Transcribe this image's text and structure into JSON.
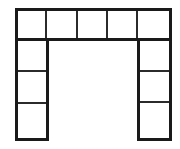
{
  "diagram": {
    "type": "floor-plan-schematic",
    "canvas": {
      "width": 180,
      "height": 149
    },
    "background_color": "#ffffff",
    "stroke_color": "#1a1a1a",
    "inner_stroke_color": "#2b2b2b",
    "fill_color": "#ffffff",
    "outer_stroke_width": 3,
    "inner_stroke_width": 2,
    "bounds": {
      "left": 16,
      "top": 9,
      "right": 170,
      "bottom": 139
    },
    "courtyard": {
      "label": "",
      "left": 47,
      "top": 39,
      "right": 138,
      "bottom": 139,
      "open": true
    },
    "top_row": {
      "label": "",
      "top": 9,
      "bottom": 39,
      "cell_count": 5,
      "x_edges": [
        16,
        46,
        77,
        107,
        137,
        170
      ],
      "cells": [
        {
          "label": "",
          "x": 16,
          "y": 9,
          "w": 30,
          "h": 30
        },
        {
          "label": "",
          "x": 46,
          "y": 9,
          "w": 31,
          "h": 30
        },
        {
          "label": "",
          "x": 77,
          "y": 9,
          "w": 30,
          "h": 30
        },
        {
          "label": "",
          "x": 107,
          "y": 9,
          "w": 30,
          "h": 30
        },
        {
          "label": "",
          "x": 137,
          "y": 9,
          "w": 33,
          "h": 30
        }
      ]
    },
    "left_leg": {
      "label": "",
      "left": 16,
      "right": 47,
      "top": 39,
      "bottom": 139,
      "cell_count": 3,
      "y_edges": [
        39,
        71,
        103,
        139
      ],
      "cells": [
        {
          "label": "",
          "x": 16,
          "y": 39,
          "w": 31,
          "h": 32
        },
        {
          "label": "",
          "x": 16,
          "y": 71,
          "w": 31,
          "h": 32
        },
        {
          "label": "",
          "x": 16,
          "y": 103,
          "w": 31,
          "h": 36
        }
      ]
    },
    "right_leg": {
      "label": "",
      "left": 138,
      "right": 170,
      "top": 39,
      "bottom": 139,
      "cell_count": 3,
      "y_edges": [
        39,
        71,
        102,
        139
      ],
      "cells": [
        {
          "label": "",
          "x": 138,
          "y": 39,
          "w": 32,
          "h": 32
        },
        {
          "label": "",
          "x": 138,
          "y": 71,
          "w": 32,
          "h": 31
        },
        {
          "label": "",
          "x": 138,
          "y": 102,
          "w": 32,
          "h": 37
        }
      ]
    },
    "totals": {
      "cell_count": 11,
      "top_row_cells": 5,
      "left_leg_cells": 3,
      "right_leg_cells": 3
    }
  }
}
